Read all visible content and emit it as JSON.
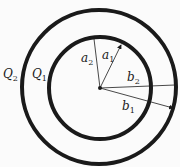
{
  "diagram": {
    "shells": [
      {
        "id": "inner",
        "charge_label": "Q",
        "charge_sub": "1",
        "inner_radius_label": "a",
        "inner_radius_sub": "1",
        "outer_radius_label": "b",
        "outer_radius_sub": "1"
      },
      {
        "id": "outer",
        "charge_label": "Q",
        "charge_sub": "2",
        "inner_radius_label": "a",
        "inner_radius_sub": "2",
        "outer_radius_label": "b",
        "outer_radius_sub": "2"
      }
    ],
    "labels": {
      "Q2": {
        "main": "Q",
        "sub": "2"
      },
      "Q1": {
        "main": "Q",
        "sub": "1"
      },
      "a2": {
        "main": "a",
        "sub": "2"
      },
      "a1": {
        "main": "a",
        "sub": "1"
      },
      "b2": {
        "main": "b",
        "sub": "2"
      },
      "b1": {
        "main": "b",
        "sub": "1"
      }
    },
    "colors": {
      "stroke": "#1a1a1a",
      "background": "#fbfbfb"
    }
  }
}
